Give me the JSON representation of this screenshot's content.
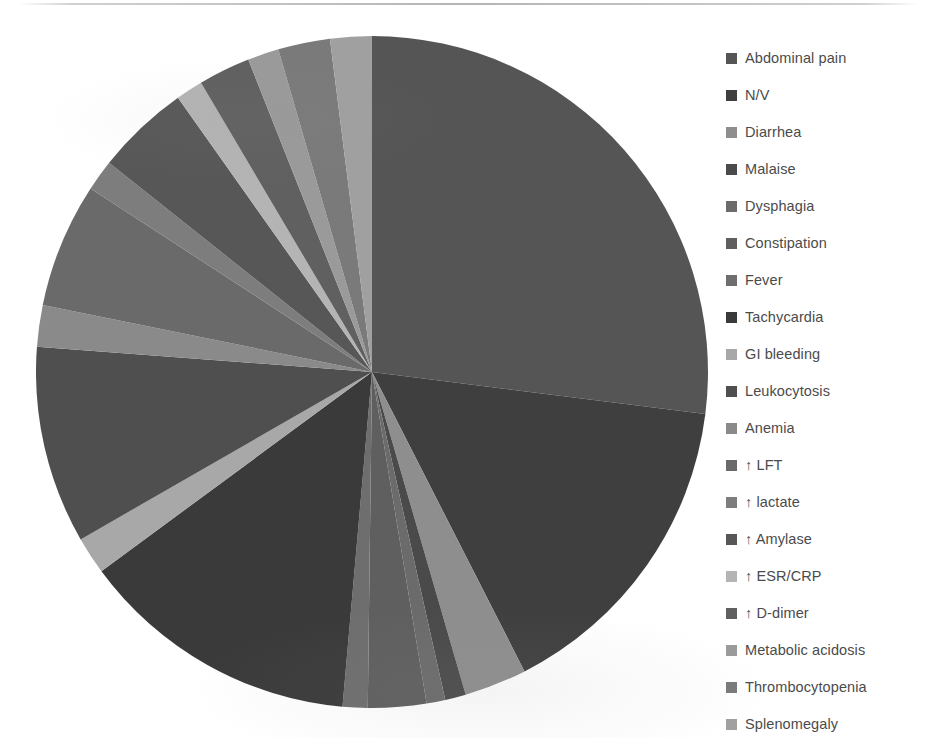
{
  "chart_data": {
    "type": "pie",
    "title": "",
    "subtitle": "",
    "legend_position": "right",
    "grid": false,
    "start_angle_deg": 0,
    "direction": "clockwise",
    "units": "percent",
    "categories": [
      "Abdominal pain",
      "N/V",
      "Diarrhea",
      "Malaise",
      "Dysphagia",
      "Constipation",
      "Fever",
      "Tachycardia",
      "GI bleeding",
      "Leukocytosis",
      "Anemia",
      "↑ LFT",
      "↑ lactate",
      "↑ Amylase",
      "↑ ESR/CRP",
      "↑ D-dimer",
      "Metabolic acidosis",
      "Thrombocytopenia",
      "Splenomegaly"
    ],
    "values": [
      27.0,
      15.5,
      3.0,
      1.0,
      0.9,
      2.8,
      1.2,
      13.5,
      1.8,
      9.5,
      2.0,
      6.0,
      1.5,
      4.5,
      1.3,
      2.5,
      1.5,
      2.5,
      2.0
    ],
    "colors": [
      "#555555",
      "#3f3f3f",
      "#8e8e8e",
      "#4a4a4a",
      "#6b6b6b",
      "#5f5f5f",
      "#6e6e6e",
      "#3a3a3a",
      "#a8a8a8",
      "#4f4f4f",
      "#8a8a8a",
      "#6a6a6a",
      "#7d7d7d",
      "#575757",
      "#b4b4b4",
      "#606060",
      "#9a9a9a",
      "#7a7a7a",
      "#a0a0a0"
    ]
  },
  "legend": {
    "items": [
      {
        "label": "Abdominal pain",
        "color": "#555555"
      },
      {
        "label": "N/V",
        "color": "#3f3f3f"
      },
      {
        "label": "Diarrhea",
        "color": "#8e8e8e"
      },
      {
        "label": "Malaise",
        "color": "#4a4a4a"
      },
      {
        "label": "Dysphagia",
        "color": "#6b6b6b"
      },
      {
        "label": "Constipation",
        "color": "#5f5f5f"
      },
      {
        "label": "Fever",
        "color": "#6e6e6e"
      },
      {
        "label": "Tachycardia",
        "color": "#3a3a3a"
      },
      {
        "label": "GI bleeding",
        "color": "#a8a8a8"
      },
      {
        "label": "Leukocytosis",
        "color": "#4f4f4f"
      },
      {
        "label": "Anemia",
        "color": "#8a8a8a"
      },
      {
        "label": "↑ LFT",
        "color": "#6a6a6a"
      },
      {
        "label": "↑ lactate",
        "color": "#7d7d7d"
      },
      {
        "label": "↑ Amylase",
        "color": "#575757"
      },
      {
        "label": "↑ ESR/CRP",
        "color": "#b4b4b4"
      },
      {
        "label": "↑ D-dimer",
        "color": "#606060"
      },
      {
        "label": "Metabolic acidosis",
        "color": "#9a9a9a"
      },
      {
        "label": "Thrombocytopenia",
        "color": "#7a7a7a"
      },
      {
        "label": "Splenomegaly",
        "color": "#a0a0a0"
      }
    ]
  }
}
